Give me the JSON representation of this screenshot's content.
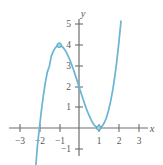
{
  "figure": {
    "background_color": "#ffffff",
    "axis_color": "#6d6e71",
    "label_color": "#58595b",
    "curve_color": "#6ab4d4",
    "marker_fill": "#9ed3e6",
    "marker_stroke": "#4da0c4"
  },
  "chart_data": {
    "type": "line",
    "title": "",
    "subtitle": "",
    "xlabel": "x",
    "ylabel": "y",
    "xlim": [
      -3.6,
      3.7
    ],
    "ylim": [
      -1.7,
      5.9
    ],
    "grid": false,
    "legend": null,
    "x_ticks": [
      -3,
      -2,
      -1,
      1,
      2,
      3
    ],
    "x_tick_labels": [
      "−3",
      "−2",
      "−1",
      "1",
      "2",
      "3"
    ],
    "y_ticks": [
      -1,
      1,
      2,
      3,
      4,
      5
    ],
    "y_tick_labels": [
      "−1",
      "1",
      "2",
      "3",
      "4",
      "5"
    ],
    "series": [
      {
        "name": "f(x) = x^3 - 3x + 2",
        "expression": "x^3 - 3*x + 2",
        "x_domain": [
          -2.32,
          2.12
        ],
        "x": [
          -2.32,
          -2.2,
          -2.1,
          -2.0,
          -1.9,
          -1.8,
          -1.7,
          -1.6,
          -1.5,
          -1.4,
          -1.3,
          -1.2,
          -1.1,
          -1.0,
          -0.9,
          -0.8,
          -0.7,
          -0.6,
          -0.5,
          -0.4,
          -0.3,
          -0.2,
          -0.1,
          0.0,
          0.1,
          0.2,
          0.3,
          0.4,
          0.5,
          0.6,
          0.7,
          0.8,
          0.9,
          1.0,
          1.1,
          1.2,
          1.3,
          1.4,
          1.5,
          1.6,
          1.7,
          1.8,
          1.9,
          2.0,
          2.1,
          2.12
        ],
        "y": [
          -3.52,
          -2.05,
          -0.86,
          0.0,
          0.84,
          1.57,
          2.19,
          2.7,
          2.97,
          3.46,
          3.7,
          3.87,
          3.97,
          4.0,
          3.97,
          3.89,
          3.76,
          3.58,
          3.38,
          3.14,
          2.87,
          2.59,
          2.3,
          2.0,
          1.7,
          1.41,
          1.13,
          0.86,
          0.63,
          0.42,
          0.24,
          0.11,
          0.03,
          0.0,
          0.03,
          0.13,
          0.3,
          0.54,
          0.88,
          1.3,
          1.81,
          2.43,
          3.16,
          4.0,
          4.96,
          5.17
        ]
      }
    ],
    "markers": [
      {
        "label": "local-maximum",
        "x": -1,
        "y": 4
      },
      {
        "label": "local-minimum",
        "x": 1,
        "y": 0
      }
    ]
  }
}
